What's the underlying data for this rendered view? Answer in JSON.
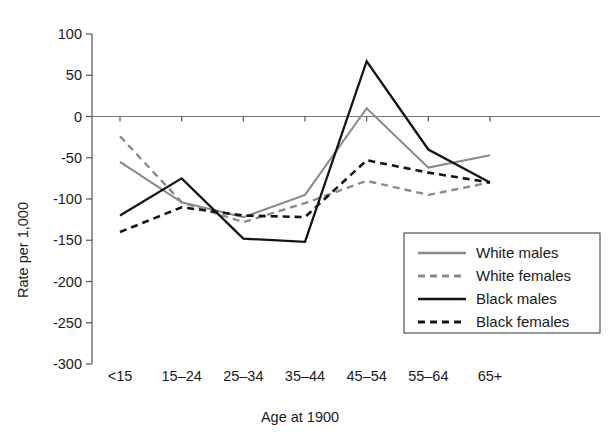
{
  "chart_data": {
    "type": "line",
    "title": "",
    "xlabel": "Age at 1900",
    "ylabel": "Rate per 1,000",
    "categories": [
      "<15",
      "15–24",
      "25–34",
      "35–44",
      "45–54",
      "55–64",
      "65+"
    ],
    "ylim": [
      -300,
      100
    ],
    "ytick_values": [
      100,
      50,
      0,
      -50,
      -100,
      -150,
      -200,
      -250,
      -300
    ],
    "ytick_labels": [
      "100",
      "50",
      "0",
      "-50",
      "-100",
      "-150",
      "-200",
      "-250",
      "-300"
    ],
    "grid": false,
    "legend_position": "lower right",
    "series": [
      {
        "name": "White males",
        "style": "solid",
        "color": "#8a8a8a",
        "values": [
          -55,
          -104,
          -122,
          -95,
          10,
          -62,
          -47
        ]
      },
      {
        "name": "White females",
        "style": "dashed",
        "color": "#8a8a8a",
        "values": [
          -24,
          -104,
          -128,
          -105,
          -78,
          -95,
          -80
        ]
      },
      {
        "name": "Black males",
        "style": "solid",
        "color": "#141414",
        "values": [
          -120,
          -75,
          -148,
          -152,
          67,
          -40,
          -80
        ]
      },
      {
        "name": "Black females",
        "style": "dashed",
        "color": "#141414",
        "values": [
          -140,
          -110,
          -120,
          -122,
          -53,
          -68,
          -80
        ]
      }
    ]
  },
  "legend": {
    "items": [
      {
        "label": "White males"
      },
      {
        "label": "White females"
      },
      {
        "label": "Black males"
      },
      {
        "label": "Black females"
      }
    ]
  }
}
